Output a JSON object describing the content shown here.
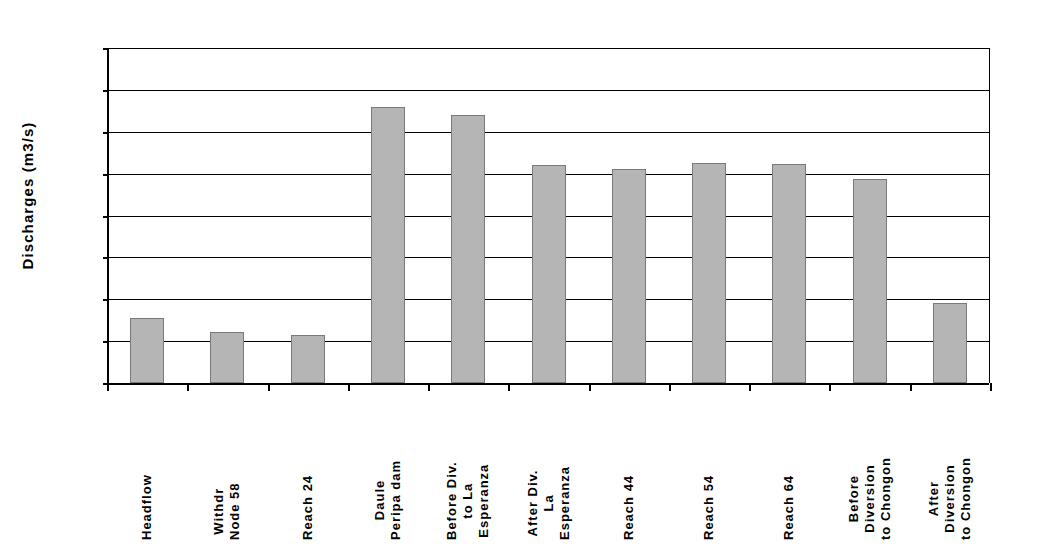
{
  "chart_data": {
    "type": "bar",
    "title": "",
    "xlabel": "",
    "ylabel": "Discharges (m3/s)",
    "ylim": [
      100,
      180
    ],
    "ytick_step": 10,
    "yticks": [
      180,
      170,
      160,
      150,
      140,
      130,
      120,
      110,
      100
    ],
    "grid": true,
    "legend": "none",
    "categories": [
      "Headflow",
      "Withdr Node 58",
      "Reach 24",
      "Daule Peripa dam",
      "Before Div. to La Esperanza",
      "After Div. La Esperanza",
      "Reach 44",
      "Reach 54",
      "Reach 64",
      "Before Diversion to Chongon",
      "After Diversion to Chongon"
    ],
    "category_label_lines": [
      [
        "Headflow"
      ],
      [
        "Withdr",
        "Node 58"
      ],
      [
        "Reach 24"
      ],
      [
        "Daule",
        "Peripa dam"
      ],
      [
        "Before Div.",
        "to La",
        "Esperanza"
      ],
      [
        "After Div.",
        "La",
        "Esperanza"
      ],
      [
        "Reach 44"
      ],
      [
        "Reach 54"
      ],
      [
        "Reach 64"
      ],
      [
        "Before",
        "Diversion",
        "to Chongon"
      ],
      [
        "After",
        "Diversion",
        "to Chongon"
      ]
    ],
    "values": [
      115.5,
      112.2,
      111.5,
      165.8,
      164.0,
      152.0,
      151.0,
      152.5,
      152.2,
      148.7,
      119.2
    ],
    "bar_color": "#b5b5b5",
    "bar_border_color": "#7a7a7a",
    "axis_color": "#000000"
  }
}
